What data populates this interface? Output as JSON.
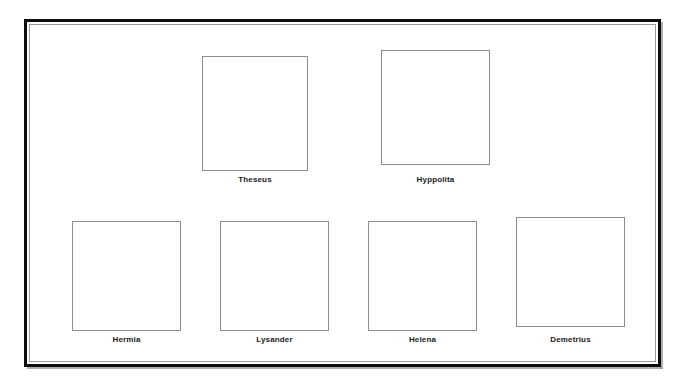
{
  "poster": {
    "frame_color": "#0d0d0d",
    "inner_line_color": "#9a9a9a",
    "box_border_color": "#8c8c8c",
    "background": "#ffffff",
    "label_color": "#1b1b1b"
  },
  "rows": [
    {
      "name": "top-row",
      "cards": [
        {
          "label": "Theseus",
          "left": 172,
          "top": 31,
          "width": 106
        },
        {
          "label": "Hyppolita",
          "left": 351,
          "top": 25,
          "width": 109
        }
      ]
    },
    {
      "name": "bottom-row",
      "cards": [
        {
          "label": "Hermia",
          "left": 42,
          "top": 196,
          "width": 109
        },
        {
          "label": "Lysander",
          "left": 190,
          "top": 196,
          "width": 109
        },
        {
          "label": "Helena",
          "left": 338,
          "top": 196,
          "width": 109
        },
        {
          "label": "Demetrius",
          "left": 486,
          "top": 192,
          "width": 109
        }
      ]
    }
  ]
}
